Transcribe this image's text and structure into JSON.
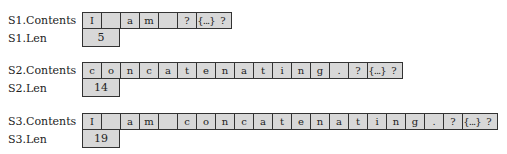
{
  "strings": [
    {
      "contents_label": "S1.Contents",
      "len_label": "S1.Len",
      "cells": [
        "I",
        " ",
        "a",
        "m",
        " ",
        "?"
      ],
      "ellipsis": "{...}",
      "trailing": "?",
      "len": "5"
    },
    {
      "contents_label": "S2.Contents",
      "len_label": "S2.Len",
      "cells": [
        "c",
        "o",
        "n",
        "c",
        "a",
        "t",
        "e",
        "n",
        "a",
        "t",
        "i",
        "n",
        "g",
        ".",
        "?"
      ],
      "ellipsis": "{...}",
      "trailing": "?",
      "len": "14"
    },
    {
      "contents_label": "S3.Contents",
      "len_label": "S3.Len",
      "cells": [
        "I",
        " ",
        "a",
        "m",
        " ",
        "c",
        "o",
        "n",
        "c",
        "a",
        "t",
        "e",
        "n",
        "a",
        "t",
        "i",
        "n",
        "g",
        ".",
        "?"
      ],
      "ellipsis": "{...}",
      "trailing": "?",
      "len": "19"
    }
  ],
  "colors": {
    "cell_fill": "#d8d8d8",
    "border": "#333333"
  }
}
